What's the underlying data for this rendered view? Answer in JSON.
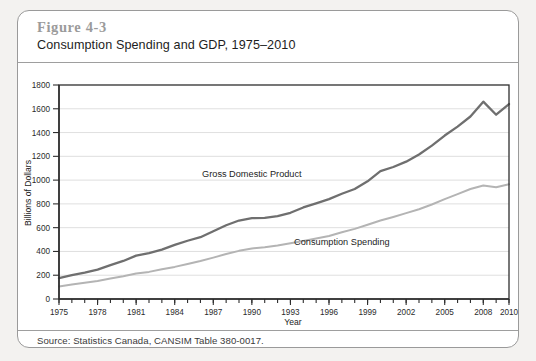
{
  "figure": {
    "number": "Figure 4-3",
    "title": "Consumption Spending and GDP, 1975–2010",
    "source": "Source: Statistics Canada, CANSIM Table 380-0017."
  },
  "colors": {
    "gdp_line": "#6f6f6f",
    "consumption_line": "#b4b4b4",
    "grid": "#c9c9c9",
    "axis": "#2e2e2e",
    "page_background": "#f3f2f0",
    "card_background": "#ffffff",
    "figure_number_text": "#9b9b9b"
  },
  "chart_data": {
    "type": "line",
    "title": "Consumption Spending and GDP, 1975–2010",
    "xlabel": "Year",
    "ylabel": "Billions of Dollars",
    "xlim": [
      1975,
      2010
    ],
    "ylim": [
      0,
      1800
    ],
    "yticks": [
      0,
      200,
      400,
      600,
      800,
      1000,
      1200,
      1400,
      1600,
      1800
    ],
    "ytick_labels": [
      "0",
      "200",
      "400",
      "600",
      "800",
      "1000",
      "1200",
      "1400",
      "1600",
      "1800"
    ],
    "xticks": [
      1975,
      1978,
      1981,
      1984,
      1987,
      1990,
      1993,
      1996,
      1999,
      2002,
      2005,
      2008,
      2010
    ],
    "xtick_labels": [
      "1975",
      "1978",
      "1981",
      "1984",
      "1987",
      "1990",
      "1993",
      "1996",
      "1999",
      "2002",
      "2005",
      "2008",
      "2010"
    ],
    "minor_xticks_every": 1,
    "grid": "horizontal",
    "legend": "inline-annotations",
    "x": [
      1975,
      1976,
      1977,
      1978,
      1979,
      1980,
      1981,
      1982,
      1983,
      1984,
      1985,
      1986,
      1987,
      1988,
      1989,
      1990,
      1991,
      1992,
      1993,
      1994,
      1995,
      1996,
      1997,
      1998,
      1999,
      2000,
      2001,
      2002,
      2003,
      2004,
      2005,
      2006,
      2007,
      2008,
      2009,
      2010
    ],
    "series": [
      {
        "name": "Gross Domestic Product",
        "color": "#6f6f6f",
        "label_x": 1990,
        "label_y": 1030,
        "values": [
          175,
          200,
          222,
          247,
          285,
          320,
          365,
          385,
          415,
          455,
          490,
          520,
          570,
          620,
          660,
          680,
          682,
          698,
          725,
          770,
          805,
          840,
          885,
          925,
          990,
          1075,
          1110,
          1155,
          1215,
          1290,
          1375,
          1450,
          1535,
          1660,
          1550,
          1640
        ]
      },
      {
        "name": "Consumption Spending",
        "color": "#b4b4b4",
        "label_x": 1997,
        "label_y": 455,
        "values": [
          105,
          122,
          137,
          152,
          172,
          192,
          215,
          228,
          250,
          270,
          295,
          320,
          348,
          378,
          405,
          425,
          435,
          450,
          468,
          488,
          508,
          530,
          562,
          590,
          625,
          660,
          690,
          722,
          755,
          795,
          840,
          882,
          925,
          955,
          940,
          965
        ]
      }
    ]
  }
}
